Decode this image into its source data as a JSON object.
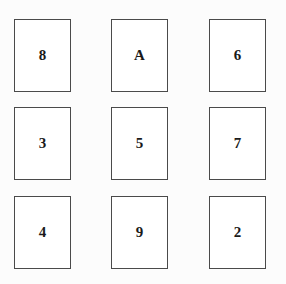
{
  "grid": {
    "rows": 3,
    "columns": 3,
    "background_color": "#fcfcfc",
    "card_background_color": "#ffffff",
    "card_border_color": "#4a4a4a",
    "label_color": "#1a1a1a",
    "cards": [
      {
        "label": "8",
        "row": 1,
        "column": 1
      },
      {
        "label": "A",
        "row": 1,
        "column": 2
      },
      {
        "label": "6",
        "row": 1,
        "column": 3
      },
      {
        "label": "3",
        "row": 2,
        "column": 1
      },
      {
        "label": "5",
        "row": 2,
        "column": 2
      },
      {
        "label": "7",
        "row": 2,
        "column": 3
      },
      {
        "label": "4",
        "row": 3,
        "column": 1
      },
      {
        "label": "9",
        "row": 3,
        "column": 2
      },
      {
        "label": "2",
        "row": 3,
        "column": 3
      }
    ]
  }
}
